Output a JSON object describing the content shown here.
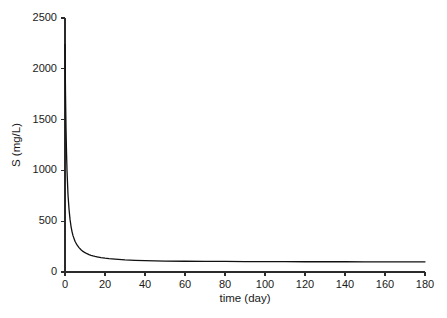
{
  "chart_data": {
    "type": "line",
    "title": "",
    "subtitle": "",
    "xlabel": "time (day)",
    "ylabel": "S (mg/L)",
    "xlim": [
      0,
      180
    ],
    "ylim": [
      0,
      2500
    ],
    "xticks": [
      0,
      20,
      40,
      60,
      80,
      100,
      120,
      140,
      160,
      180
    ],
    "yticks": [
      0,
      500,
      1000,
      1500,
      2000,
      2500
    ],
    "xtick_labels": [
      "0",
      "20",
      "40",
      "60",
      "80",
      "100",
      "120",
      "140",
      "160",
      "180"
    ],
    "ytick_labels": [
      "0",
      "500",
      "1000",
      "1500",
      "2000",
      "2500"
    ],
    "grid": false,
    "legend": null,
    "legend_position": "none",
    "annotations": [],
    "series": [
      {
        "name": "S",
        "color": "#111111",
        "line_width": 1.3,
        "x": [
          0,
          0.25,
          0.5,
          0.75,
          1,
          1.5,
          2,
          2.5,
          3,
          3.5,
          4,
          5,
          6,
          7,
          8,
          9,
          10,
          11,
          12,
          13,
          14,
          15,
          16,
          18,
          20,
          22,
          25,
          30,
          35,
          40,
          50,
          60,
          70,
          80,
          90,
          100,
          110,
          120,
          130,
          140,
          150,
          160,
          170,
          180
        ],
        "y": [
          2240,
          1760,
          1420,
          1180,
          1000,
          760,
          620,
          520,
          450,
          398,
          358,
          303,
          266,
          240,
          219,
          203,
          190,
          180,
          171,
          164,
          158,
          153,
          149,
          142,
          136,
          131,
          126,
          119,
          115,
          112,
          108,
          106,
          105,
          104,
          103,
          102,
          102,
          101,
          101,
          101,
          100,
          100,
          100,
          100
        ]
      }
    ],
    "plateau_value": 100,
    "initial_value": 2240,
    "background_color": "#ffffff",
    "axis_color": "#2b2b2b"
  },
  "layout": {
    "plot_left_px": 65,
    "plot_right_px": 425,
    "plot_top_px": 18,
    "plot_bottom_px": 272,
    "tick_length_px": 4,
    "xlabel_x_px": 245,
    "xlabel_y_px": 302,
    "ylabel_x_px": 20,
    "ylabel_y_px": 145
  }
}
